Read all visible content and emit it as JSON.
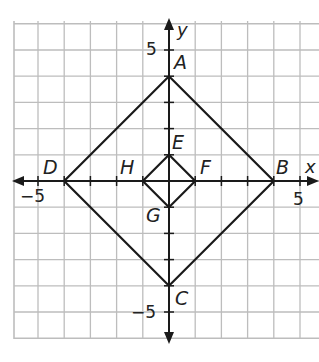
{
  "diagram": {
    "type": "coordinate-plane",
    "axes": {
      "x_label": "x",
      "y_label": "y"
    },
    "tick_labels": {
      "x_neg": "−5",
      "x_pos": "5",
      "y_pos": "5",
      "y_neg": "−5"
    },
    "range": {
      "x": [
        -6,
        6
      ],
      "y": [
        -6,
        6
      ]
    },
    "outer_square": {
      "vertices": [
        {
          "label": "A",
          "x": 0,
          "y": 4
        },
        {
          "label": "B",
          "x": 4,
          "y": 0
        },
        {
          "label": "C",
          "x": 0,
          "y": -4
        },
        {
          "label": "D",
          "x": -4,
          "y": 0
        }
      ]
    },
    "inner_square": {
      "vertices": [
        {
          "label": "E",
          "x": 0,
          "y": 1
        },
        {
          "label": "F",
          "x": 1,
          "y": 0
        },
        {
          "label": "G",
          "x": 0,
          "y": -1
        },
        {
          "label": "H",
          "x": -1,
          "y": 0
        }
      ]
    },
    "colors": {
      "grid": "#bdbdbd",
      "lines": "#1a1a1a",
      "text": "#222222"
    }
  }
}
